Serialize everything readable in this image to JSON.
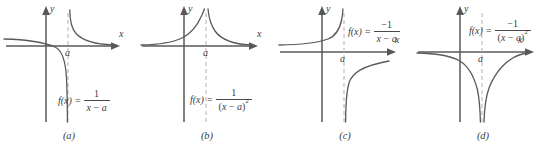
{
  "figure": {
    "panels": [
      {
        "id": "a",
        "caption": "(a)",
        "x_axis_label": "x",
        "y_axis_label": "y",
        "asymptote_tick_label": "a",
        "function_lhs": "f(x)",
        "equals": "=",
        "numerator": "1",
        "denominator_open": "",
        "denominator_var": "x",
        "denominator_op": " − ",
        "denominator_param": "a",
        "denominator_close": "",
        "exponent": "",
        "description": "Hyperbola 1/(x-a): left branch to -infinity, right branch from +infinity"
      },
      {
        "id": "b",
        "caption": "(b)",
        "x_axis_label": "x",
        "y_axis_label": "y",
        "asymptote_tick_label": "a",
        "function_lhs": "f(x)",
        "equals": "=",
        "numerator": "1",
        "denominator_open": "(",
        "denominator_var": "x",
        "denominator_op": " − ",
        "denominator_param": "a",
        "denominator_close": ")",
        "exponent": "2",
        "description": "1/(x-a)^2: both branches rise to +infinity at the asymptote"
      },
      {
        "id": "c",
        "caption": "(c)",
        "x_axis_label": "x",
        "y_axis_label": "y",
        "asymptote_tick_label": "a",
        "function_lhs": "f(x)",
        "equals": "=",
        "numerator": "−1",
        "denominator_open": "",
        "denominator_var": "x",
        "denominator_op": " − ",
        "denominator_param": "a",
        "denominator_close": "",
        "exponent": "",
        "description": "-1/(x-a): left branch to +infinity, right branch from -infinity"
      },
      {
        "id": "d",
        "caption": "(d)",
        "x_axis_label": "x",
        "y_axis_label": "y",
        "asymptote_tick_label": "a",
        "function_lhs": "f(x)",
        "equals": "=",
        "numerator": "−1",
        "denominator_open": "(",
        "denominator_var": "x",
        "denominator_op": " − ",
        "denominator_param": "a",
        "denominator_close": ")",
        "exponent": "2",
        "description": "-1/(x-a)^2: both branches fall to -infinity at the asymptote"
      }
    ],
    "colors": {
      "curve": "#5a5a5c",
      "axis": "#58585a",
      "asymptote": "#b9b9bb",
      "text": "#3b3b3b",
      "background": "#ffffff"
    }
  }
}
